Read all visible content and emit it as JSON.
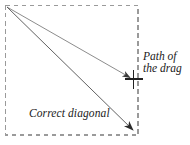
{
  "figure": {
    "background_color": "#ffffff",
    "width": 190,
    "height": 145,
    "selection_rect": {
      "name": "dashed selection rectangle",
      "stroke_color": "#9a9a9a",
      "stroke_style": "dashed",
      "x": 5,
      "y": 5,
      "width": 133,
      "height": 130
    },
    "arrows": [
      {
        "name": "path-of-the-drag-arrow",
        "from": [
          7,
          7
        ],
        "to": [
          133,
          79
        ],
        "color": "#6f6f6f",
        "description": "Arrow from top-left corner to the crosshair on the right edge"
      },
      {
        "name": "correct-diagonal-arrow",
        "from": [
          7,
          7
        ],
        "to": [
          137,
          134
        ],
        "color": "#4a4a4a",
        "description": "Arrow from top-left corner to the bottom-right corner"
      }
    ],
    "crosshair": {
      "name": "crosshair cursor marker",
      "x": 133,
      "y": 79,
      "color": "#2b2b2b",
      "arm_length": 9
    },
    "labels": {
      "correct_diagonal": "Correct diagonal",
      "path_of_the_drag_line1": "Path of",
      "path_of_the_drag_line2": "the drag"
    }
  }
}
